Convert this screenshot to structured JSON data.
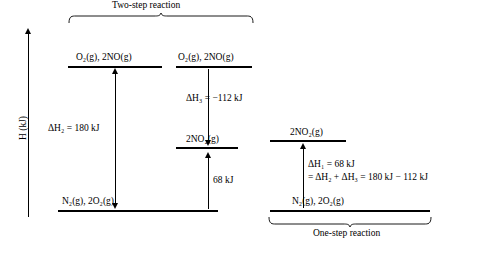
{
  "axis": {
    "y_label": "H (kJ)"
  },
  "annotations": {
    "two_step_label": "Two-step reaction",
    "one_step_label": "One-step reaction"
  },
  "left_panel": {
    "top_level_label": "O₂(g), 2NO(g)",
    "bottom_level_label": "N₂(g), 2O₂(g)",
    "delta_label": "ΔH₂ = 180 kJ"
  },
  "middle_panel": {
    "top_level_label": "O₂(g), 2NO(g)",
    "middle_level_label": "2NO₂(g)",
    "bottom_level_label": "",
    "delta_top_label": "ΔH₃ = −112 kJ",
    "delta_bottom_label": "68 kJ"
  },
  "right_panel": {
    "top_level_label": "2NO₂(g)",
    "bottom_level_label": "N₂(g), 2O₂(g)",
    "delta_label_line1": "ΔH₁ = 68 kJ",
    "delta_label_line2": "= ΔH₂ + ΔH₃ = 180 kJ − 112 kJ"
  },
  "colors": {
    "ink": "#000000",
    "background": "#ffffff"
  }
}
